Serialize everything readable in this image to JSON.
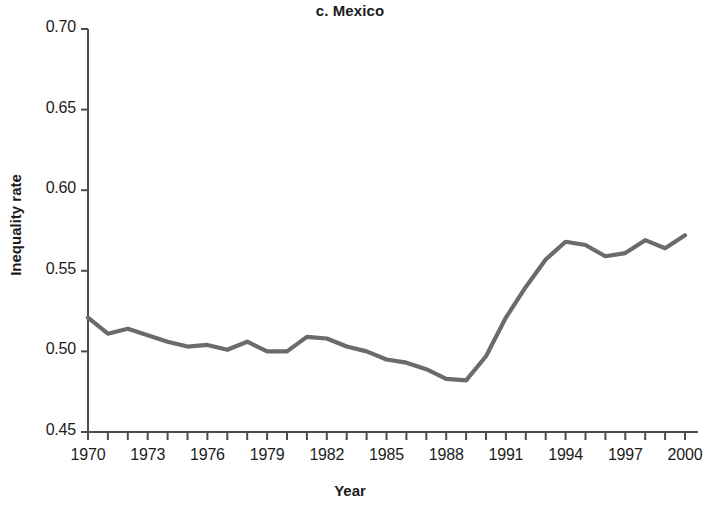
{
  "chart_data": {
    "type": "line",
    "title": "c. Mexico",
    "xlabel": "Year",
    "ylabel": "Inequality rate",
    "xlim": [
      1969,
      2001
    ],
    "ylim": [
      0.45,
      0.7
    ],
    "grid": false,
    "legend": null,
    "line_color": "#6b6b6b",
    "x": [
      1970,
      1971,
      1972,
      1973,
      1974,
      1975,
      1976,
      1977,
      1978,
      1979,
      1980,
      1981,
      1982,
      1983,
      1984,
      1985,
      1986,
      1987,
      1988,
      1989,
      1990,
      1991,
      1992,
      1993,
      1994,
      1995,
      1996,
      1997,
      1998,
      1999,
      2000
    ],
    "values": [
      0.521,
      0.511,
      0.514,
      0.51,
      0.506,
      0.503,
      0.504,
      0.501,
      0.506,
      0.5,
      0.5,
      0.509,
      0.508,
      0.503,
      0.5,
      0.495,
      0.493,
      0.489,
      0.483,
      0.482,
      0.497,
      0.521,
      0.54,
      0.557,
      0.568,
      0.566,
      0.559,
      0.561,
      0.569,
      0.564,
      0.572
    ],
    "ytick_labels": [
      "0.70",
      "0.65",
      "0.60",
      "0.55",
      "0.50",
      "0.45"
    ],
    "ytick_values": [
      0.7,
      0.65,
      0.6,
      0.55,
      0.5,
      0.45
    ],
    "xtick_labels": [
      "1970",
      "1973",
      "1976",
      "1979",
      "1982",
      "1985",
      "1988",
      "1991",
      "1994",
      "1997",
      "2000"
    ],
    "xtick_values": [
      1970,
      1973,
      1976,
      1979,
      1982,
      1985,
      1988,
      1991,
      1994,
      1997,
      2000
    ],
    "xminor_every": 1,
    "axis_color": "#4d4d4d"
  }
}
